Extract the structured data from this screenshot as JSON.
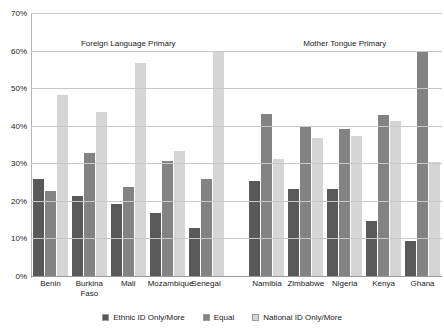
{
  "chart_data": {
    "type": "bar",
    "title": "",
    "xlabel": "",
    "ylabel": "",
    "ylim": [
      0,
      70
    ],
    "ytick_labels": [
      "0%",
      "10%",
      "20%",
      "30%",
      "40%",
      "50%",
      "60%",
      "70%"
    ],
    "ytick_values": [
      0,
      10,
      20,
      30,
      40,
      50,
      60,
      70
    ],
    "grid": true,
    "legend_position": "bottom",
    "panels": [
      {
        "title": "Foreign Language Primary"
      },
      {
        "title": "Mother Tongue Primary"
      }
    ],
    "categories": [
      "Benin",
      "Burkina Faso",
      "Mali",
      "Mozambique",
      "Senegal",
      "Namibia",
      "Zimbabwe",
      "Nigeria",
      "Kenya",
      "Ghana"
    ],
    "series": [
      {
        "name": "Ethnic ID Only/More",
        "color": "#595959",
        "values": [
          26,
          21.5,
          19.5,
          17,
          13,
          25.5,
          23.5,
          23.5,
          15,
          9.5
        ]
      },
      {
        "name": "Equal",
        "color": "#838383",
        "values": [
          23,
          33,
          24,
          31,
          26,
          43.5,
          40,
          39.5,
          43,
          60
        ]
      },
      {
        "name": "National ID Only/More",
        "color": "#d5d5d5",
        "values": [
          48.5,
          44,
          57,
          33.5,
          60,
          31.5,
          37,
          37.5,
          41.5,
          30.5
        ]
      }
    ]
  }
}
